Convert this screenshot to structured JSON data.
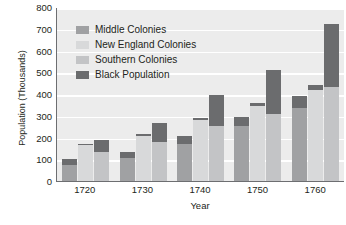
{
  "chart_data": {
    "type": "bar",
    "title": "",
    "xlabel": "Year",
    "ylabel": "Population (Thousands)",
    "categories": [
      "1720",
      "1730",
      "1740",
      "1750",
      "1760"
    ],
    "ylim": [
      0,
      800
    ],
    "yticks": [
      0,
      100,
      200,
      300,
      400,
      500,
      600,
      700,
      800
    ],
    "grid": true,
    "legend_position": "top-left",
    "stacked_groups": true,
    "series": [
      {
        "name": "Middle Colonies",
        "color": "#a0a1a3",
        "values": [
          75,
          105,
          170,
          255,
          335
        ]
      },
      {
        "name": "New England Colonies",
        "color": "#d8d9da",
        "values": [
          165,
          205,
          280,
          345,
          420
        ]
      },
      {
        "name": "Southern Colonies",
        "color": "#c3c4c6",
        "values": [
          135,
          180,
          255,
          310,
          430
        ]
      },
      {
        "name": "Black Population",
        "color": "#6b6c6e",
        "stacked_on": [
          "Middle Colonies",
          "New England Colonies",
          "Southern Colonies"
        ],
        "values_by_group": {
          "Middle Colonies": [
            25,
            30,
            35,
            40,
            55
          ],
          "New England Colonies": [
            5,
            10,
            10,
            15,
            20
          ],
          "Southern Colonies": [
            55,
            85,
            140,
            200,
            290
          ]
        }
      }
    ],
    "totals": {
      "Middle Colonies": [
        100,
        135,
        205,
        295,
        390
      ],
      "New England Colonies": [
        170,
        215,
        290,
        360,
        440
      ],
      "Southern Colonies": [
        190,
        265,
        395,
        510,
        720
      ]
    }
  },
  "legend": {
    "items": [
      {
        "label": "Middle Colonies",
        "color": "#a0a1a3",
        "icon": "legend-swatch"
      },
      {
        "label": "New England Colonies",
        "color": "#d8d9da",
        "icon": "legend-swatch"
      },
      {
        "label": "Southern Colonies",
        "color": "#c3c4c6",
        "icon": "legend-swatch"
      },
      {
        "label": "Black Population",
        "color": "#6b6c6e",
        "icon": "legend-swatch"
      }
    ]
  },
  "colors": {
    "plot_background": "#ececec",
    "gridline": "#ffffff",
    "axis": "#6d6e71",
    "text": "#231f20"
  }
}
